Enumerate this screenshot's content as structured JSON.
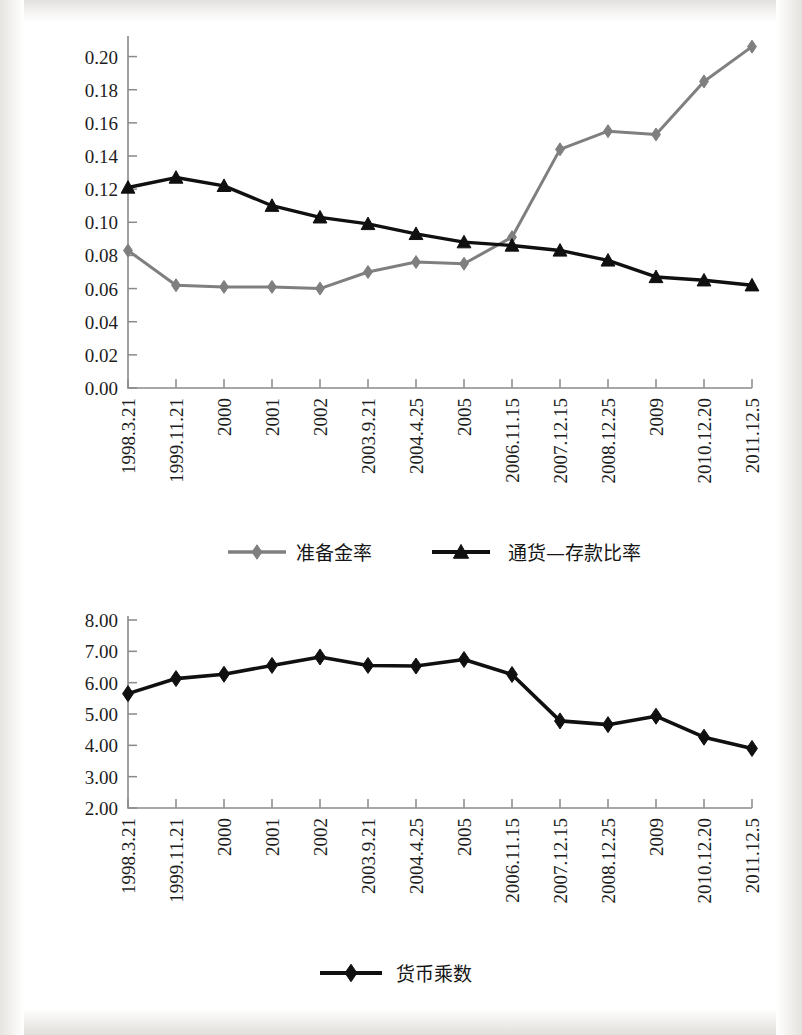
{
  "page": {
    "background_color": "#ffffff",
    "scan_edge_color": "#e6e4e1"
  },
  "charts": [
    {
      "id": "chart-reserve-currency-ratio",
      "legend_position": "bottom",
      "series_colors": [
        "#7f7f7f",
        "#101010"
      ]
    },
    {
      "id": "chart-money-multiplier",
      "legend_position": "bottom",
      "series_colors": [
        "#101010"
      ]
    }
  ],
  "chart_data": [
    {
      "type": "line",
      "title": "",
      "xlabel": "",
      "ylabel": "",
      "ylim": [
        0.0,
        0.21
      ],
      "yticks": [
        0.0,
        0.02,
        0.04,
        0.06,
        0.08,
        0.1,
        0.12,
        0.14,
        0.16,
        0.18,
        0.2
      ],
      "ytick_labels": [
        "0.00",
        "0.02",
        "0.04",
        "0.06",
        "0.08",
        "0.10",
        "0.12",
        "0.14",
        "0.16",
        "0.18",
        "0.20"
      ],
      "grid": false,
      "legend_position": "bottom",
      "categories": [
        "1998.3.21",
        "1999.11.21",
        "2000",
        "2001",
        "2002",
        "2003.9.21",
        "2004.4.25",
        "2005",
        "2006.11.15",
        "2007.12.15",
        "2008.12.25",
        "2009",
        "2010.12.20",
        "2011.12.5"
      ],
      "series": [
        {
          "name": "准备金率",
          "marker": "diamond",
          "color": "#7f7f7f",
          "values": [
            0.083,
            0.062,
            0.061,
            0.061,
            0.06,
            0.07,
            0.076,
            0.075,
            0.091,
            0.144,
            0.155,
            0.153,
            0.185,
            0.206
          ]
        },
        {
          "name": "通货—存款比率",
          "marker": "triangle",
          "color": "#101010",
          "values": [
            0.121,
            0.127,
            0.122,
            0.11,
            0.103,
            0.099,
            0.093,
            0.088,
            0.086,
            0.083,
            0.077,
            0.067,
            0.065,
            0.062
          ]
        }
      ]
    },
    {
      "type": "line",
      "title": "",
      "xlabel": "",
      "ylabel": "",
      "ylim": [
        2.0,
        8.0
      ],
      "yticks": [
        2.0,
        3.0,
        4.0,
        5.0,
        6.0,
        7.0,
        8.0
      ],
      "ytick_labels": [
        "2.00",
        "3.00",
        "4.00",
        "5.00",
        "6.00",
        "7.00",
        "8.00"
      ],
      "grid": false,
      "legend_position": "bottom",
      "categories": [
        "1998.3.21",
        "1999.11.21",
        "2000",
        "2001",
        "2002",
        "2003.9.21",
        "2004.4.25",
        "2005",
        "2006.11.15",
        "2007.12.15",
        "2008.12.25",
        "2009",
        "2010.12.20",
        "2011.12.5"
      ],
      "series": [
        {
          "name": "货币乘数",
          "marker": "diamond",
          "color": "#101010",
          "values": [
            5.65,
            6.13,
            6.27,
            6.55,
            6.82,
            6.55,
            6.53,
            6.74,
            6.26,
            4.78,
            4.66,
            4.93,
            4.26,
            3.9
          ]
        }
      ]
    }
  ]
}
